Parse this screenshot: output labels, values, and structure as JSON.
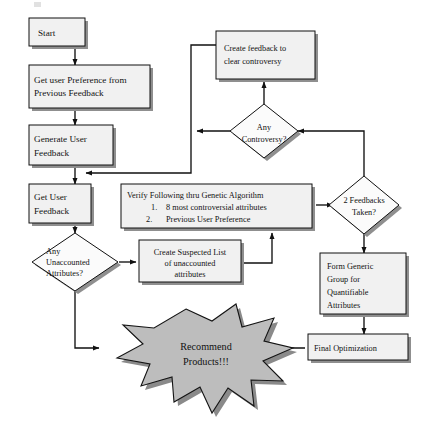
{
  "diagram": {
    "type": "flowchart",
    "colors": {
      "process_fill": "#f1f1f1",
      "decision_fill": "#fbfbfb",
      "burst_fill": "#bdbdbd",
      "shadow": "#8f8f8f",
      "line": "#111111",
      "background": "#ffffff"
    },
    "nodes": {
      "start": {
        "label": "Start",
        "shape": "process"
      },
      "get_preference": {
        "line1": "Get user Preference from",
        "line2": "Previous Feedback",
        "shape": "process"
      },
      "generate_feedback": {
        "line1": "Generate User",
        "line2": "Feedback",
        "shape": "process"
      },
      "get_feedback": {
        "line1": "Get User",
        "line2": "Feedback",
        "shape": "process"
      },
      "any_unaccounted": {
        "line1": "Any",
        "line2": "Unaccounted",
        "line3": "Attributes?",
        "shape": "decision"
      },
      "create_suspected": {
        "line1": "Create Suspected List",
        "line2": "of unaccounted",
        "line3": "attributes",
        "shape": "process"
      },
      "verify_following": {
        "heading": "Verify Following thru Genetic Algorithm",
        "items": [
          {
            "number": "1.",
            "text": "8 most controversial attributes"
          },
          {
            "number": "2.",
            "text": "Previous User Preference"
          }
        ],
        "shape": "process"
      },
      "two_feedbacks": {
        "line1": "2 Feedbacks",
        "line2": "Taken?",
        "shape": "decision"
      },
      "any_controversy": {
        "line1": "Any",
        "line2": "Controversy?",
        "shape": "decision"
      },
      "create_feedback": {
        "line1": "Create feedback to",
        "line2": "clear controversy",
        "shape": "process"
      },
      "form_generic_group": {
        "line1": "Form Generic",
        "line2": "Group for",
        "line3": "Quantifiable",
        "line4": "Attributes",
        "shape": "process"
      },
      "final_optimization": {
        "label": "Final Optimization",
        "shape": "process"
      },
      "recommend_products": {
        "line1": "Recommend",
        "line2": "Products!!!",
        "shape": "starburst"
      }
    },
    "edges": [
      {
        "from": "start",
        "to": "get_preference"
      },
      {
        "from": "get_preference",
        "to": "generate_feedback"
      },
      {
        "from": "generate_feedback",
        "to": "get_feedback"
      },
      {
        "from": "get_feedback",
        "to": "any_unaccounted"
      },
      {
        "from": "any_unaccounted",
        "to": "create_suspected"
      },
      {
        "from": "any_unaccounted",
        "to": "recommend_products"
      },
      {
        "from": "create_suspected",
        "to": "verify_following"
      },
      {
        "from": "verify_following",
        "to": "two_feedbacks"
      },
      {
        "from": "two_feedbacks",
        "to": "any_controversy"
      },
      {
        "from": "two_feedbacks",
        "to": "form_generic_group"
      },
      {
        "from": "any_controversy",
        "to": "create_feedback"
      },
      {
        "from": "any_controversy",
        "to": "generate_feedback"
      },
      {
        "from": "create_feedback",
        "to": "generate_feedback"
      },
      {
        "from": "form_generic_group",
        "to": "final_optimization"
      },
      {
        "from": "final_optimization",
        "to": "recommend_products"
      }
    ]
  }
}
